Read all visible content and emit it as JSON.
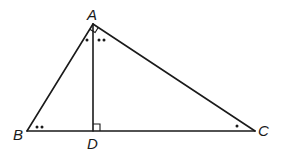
{
  "diagram": {
    "type": "right triangle with altitude",
    "points": {
      "A": {
        "label": "A",
        "x": 93,
        "y": 24
      },
      "B": {
        "label": "B",
        "x": 27,
        "y": 131
      },
      "C": {
        "label": "C",
        "x": 255,
        "y": 131
      },
      "D": {
        "label": "D",
        "x": 93,
        "y": 131
      }
    },
    "segments": [
      "AB",
      "AC",
      "BC",
      "AD"
    ],
    "right_angles": [
      "BAC",
      "ADB"
    ],
    "angle_marks": [
      {
        "vertex": "B",
        "marks": 2,
        "description": "two dots at angle B"
      },
      {
        "vertex": "A",
        "side": "BAD",
        "marks": 1,
        "description": "one dot at angle BAD"
      },
      {
        "vertex": "A",
        "side": "DAC",
        "marks": 2,
        "description": "two dots at angle DAC"
      },
      {
        "vertex": "C",
        "marks": 1,
        "description": "one dot at angle C"
      }
    ],
    "colors": {
      "stroke": "#1a1a1a",
      "background": "#ffffff"
    }
  }
}
